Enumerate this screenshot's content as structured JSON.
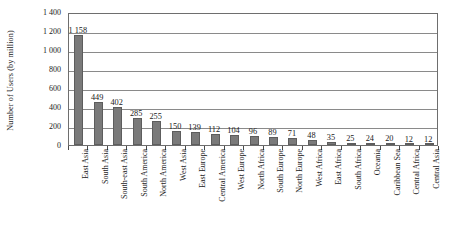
{
  "chart_data": {
    "type": "bar",
    "title": "",
    "xlabel": "",
    "ylabel": "Number of Users (by million)",
    "ylim": [
      0,
      1400
    ],
    "ytick_step": 200,
    "ytick_labels": [
      "1 400",
      "1 200",
      "1 000",
      "800",
      "600",
      "400",
      "200",
      "0"
    ],
    "ytick_values": [
      1400,
      1200,
      1000,
      800,
      600,
      400,
      200,
      0
    ],
    "grid": true,
    "legend": "none",
    "bar_color": "#7a7a7a",
    "plot_border_color": "#6e6e6e",
    "categories": [
      "East Asia",
      "South Asia",
      "South-east Asia",
      "South America",
      "North America",
      "West Asia",
      "East Europe",
      "Central America",
      "West Europe",
      "North Africa",
      "South Europe",
      "North Europe",
      "West Africa",
      "East Africa",
      "South Africa",
      "Oceania",
      "Caribbean Sea",
      "Central Africa",
      "Central Asia"
    ],
    "values": [
      1158,
      449,
      402,
      285,
      255,
      150,
      139,
      112,
      104,
      96,
      89,
      71,
      48,
      35,
      25,
      24,
      20,
      12,
      12
    ],
    "value_labels": [
      "1 158",
      "449",
      "402",
      "285",
      "255",
      "150",
      "139",
      "112",
      "104",
      "96",
      "89",
      "71",
      "48",
      "35",
      "25",
      "24",
      "20",
      "12",
      "12"
    ]
  }
}
